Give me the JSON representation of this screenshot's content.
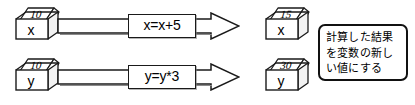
{
  "diagram": {
    "type": "variable-assignment-illustration",
    "language": "ja",
    "rows": [
      {
        "id": "row-x",
        "source_box": {
          "variable": "x",
          "value": "10"
        },
        "operation": {
          "label": "x=x+5"
        },
        "result_box": {
          "variable": "x",
          "value": "15"
        },
        "arrow": {
          "direction": "right"
        }
      },
      {
        "id": "row-y",
        "source_box": {
          "variable": "y",
          "value": "10"
        },
        "operation": {
          "label": "y=y*3"
        },
        "result_box": {
          "variable": "y",
          "value": "30"
        },
        "arrow": {
          "direction": "right"
        }
      }
    ],
    "note": {
      "lines": [
        "計算した結果",
        "を変数の新し",
        "い値にする"
      ]
    },
    "colors": {
      "ink": "#1a1a1a",
      "paper": "#ffffff",
      "shadow": "#787878"
    }
  }
}
